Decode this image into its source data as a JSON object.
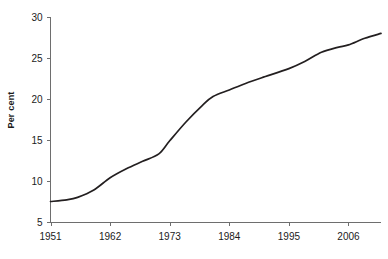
{
  "chart_data": {
    "type": "line",
    "title": "",
    "xlabel": "",
    "ylabel": "Per cent",
    "xlim": [
      1951,
      2012
    ],
    "ylim": [
      5,
      30
    ],
    "grid": false,
    "legend": "none",
    "x_tick_labels": [
      "1951",
      "1962",
      "1973",
      "1984",
      "1995",
      "2006"
    ],
    "x_tick_values": [
      1951,
      1962,
      1973,
      1984,
      1995,
      2006
    ],
    "y_tick_labels": [
      "5",
      "10",
      "15",
      "20",
      "25",
      "30"
    ],
    "y_tick_values": [
      5,
      10,
      15,
      20,
      25,
      30
    ],
    "series": [
      {
        "name": "Per cent",
        "color": "#231f20",
        "x": [
          1951,
          1954,
          1956,
          1959,
          1962,
          1965,
          1968,
          1971,
          1973,
          1976,
          1979,
          1981,
          1984,
          1987,
          1990,
          1995,
          1998,
          2001,
          2004,
          2006,
          2009,
          2012
        ],
        "values": [
          7.5,
          7.7,
          8.0,
          8.9,
          10.4,
          11.5,
          12.4,
          13.3,
          14.9,
          17.2,
          19.2,
          20.3,
          21.1,
          21.9,
          22.6,
          23.7,
          24.6,
          25.7,
          26.3,
          26.6,
          27.4,
          28.0
        ]
      }
    ],
    "axis_color": "#6e6e6e",
    "background": "#ffffff"
  },
  "labels": {
    "y_axis_title": "Per cent"
  }
}
